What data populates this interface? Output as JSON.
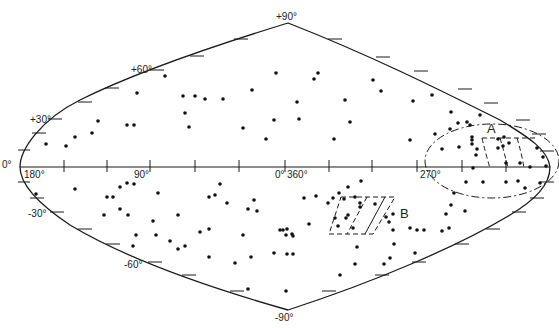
{
  "diagram": {
    "type": "sky-map",
    "projection": "sinusoidal (equal-area) galactic coordinates",
    "colors": {
      "ink": "#1a1a1a",
      "background": "#ffffff"
    },
    "latitude_labels": [
      {
        "text": "+90°",
        "x": 285,
        "y": 20
      },
      {
        "text": "+60°",
        "x": 140,
        "y": 72
      },
      {
        "text": "+30°",
        "x": 40,
        "y": 123
      },
      {
        "text": "0°",
        "x": 5,
        "y": 168
      },
      {
        "text": "-30°",
        "x": 38,
        "y": 217
      },
      {
        "text": "-60°",
        "x": 134,
        "y": 267
      },
      {
        "text": "-90°",
        "x": 285,
        "y": 320
      }
    ],
    "longitude_labels": [
      {
        "text": "180°",
        "x": 34,
        "y": 178
      },
      {
        "text": "90°",
        "x": 141,
        "y": 178
      },
      {
        "text": "0°",
        "x": 275,
        "y": 178
      },
      {
        "text": "360°",
        "x": 302,
        "y": 178
      },
      {
        "text": "270°",
        "x": 426,
        "y": 178
      }
    ],
    "regions": [
      {
        "label": "A",
        "label_x": 487,
        "label_y": 132,
        "shape": "dash-dot ellipse with dashed grid patch"
      },
      {
        "label": "B",
        "label_x": 400,
        "label_y": 218,
        "shape": "dashed parallelogram"
      }
    ]
  }
}
